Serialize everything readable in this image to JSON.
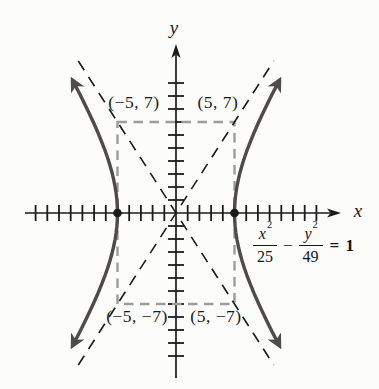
{
  "figure": {
    "labels": {
      "y_axis": "y",
      "x_axis": "x",
      "corner_top_left": "(−5, 7)",
      "corner_top_right": "(5, 7)",
      "corner_bottom_left": "(−5, −7)",
      "corner_bottom_right": "(5, −7)"
    },
    "equation": {
      "text": "x²/25 − y²/49 = 1",
      "num1_var": "x",
      "num1_exp": "2",
      "den1": "25",
      "operator": "−",
      "num2_var": "y",
      "num2_exp": "2",
      "den2": "49",
      "rhs": "= 1"
    }
  },
  "chart_data": {
    "type": "line",
    "subtype": "hyperbola-graph",
    "title": "",
    "equation": "x²/25 − y²/49 = 1",
    "curve": {
      "a": 5,
      "b": 7,
      "opens": "left-right",
      "t_max": 1.16
    },
    "vertices": [
      [
        -5,
        0
      ],
      [
        5,
        0
      ]
    ],
    "rectangle": {
      "x1": -5,
      "x2": 5,
      "y1": -7,
      "y2": 7
    },
    "rectangle_corner_labels": [
      "(−5, 7)",
      "(5, 7)",
      "(−5, −7)",
      "(5, −7)"
    ],
    "asymptotes": [
      {
        "slope": 1.4
      },
      {
        "slope": -1.4
      }
    ],
    "asymptote_extent": 8.35,
    "axes": {
      "x_label": "x",
      "y_label": "y",
      "x_tick_min": -12,
      "x_tick_max": 12,
      "y_tick_min": -11,
      "y_tick_max": 10,
      "tick_step": 1,
      "xlim": [
        -13.5,
        14
      ],
      "ylim": [
        -13,
        13
      ],
      "grid": false
    },
    "mapping": {
      "ox": 176,
      "oy": 213,
      "ux": 11.7,
      "uy": 13
    },
    "colors": {
      "curve": "#4e4b49",
      "rect": "#9c9c9c",
      "axis": "#1b1b1b",
      "background": "#fcfcfa"
    }
  }
}
